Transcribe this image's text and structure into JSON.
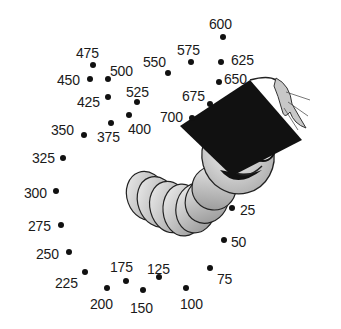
{
  "worksheet": {
    "title": "",
    "picture": "graduate-worm-with-glasses-and-mortarboard",
    "colors": {
      "ink": "#111111",
      "worm_light": "#e8e8e8",
      "worm_dark": "#9a9a9a",
      "cap": "#111111",
      "tassel": "#c8c8c8"
    },
    "dots": [
      {
        "label": "25",
        "x": 232,
        "y": 208,
        "lx": 240,
        "ly": 203
      },
      {
        "label": "50",
        "x": 224,
        "y": 240,
        "lx": 231,
        "ly": 235
      },
      {
        "label": "75",
        "x": 210,
        "y": 268,
        "lx": 217,
        "ly": 272
      },
      {
        "label": "100",
        "x": 186,
        "y": 288,
        "lx": 180,
        "ly": 297
      },
      {
        "label": "125",
        "x": 159,
        "y": 277,
        "lx": 147,
        "ly": 262
      },
      {
        "label": "150",
        "x": 143,
        "y": 290,
        "lx": 130,
        "ly": 301
      },
      {
        "label": "175",
        "x": 126,
        "y": 281,
        "lx": 110,
        "ly": 260
      },
      {
        "label": "200",
        "x": 107,
        "y": 288,
        "lx": 90,
        "ly": 297
      },
      {
        "label": "225",
        "x": 85,
        "y": 272,
        "lx": 55,
        "ly": 276
      },
      {
        "label": "250",
        "x": 69,
        "y": 252,
        "lx": 36,
        "ly": 247
      },
      {
        "label": "275",
        "x": 61,
        "y": 225,
        "lx": 28,
        "ly": 219
      },
      {
        "label": "300",
        "x": 56,
        "y": 191,
        "lx": 24,
        "ly": 186
      },
      {
        "label": "325",
        "x": 63,
        "y": 158,
        "lx": 32,
        "ly": 151
      },
      {
        "label": "350",
        "x": 84,
        "y": 135,
        "lx": 51,
        "ly": 123
      },
      {
        "label": "375",
        "x": 111,
        "y": 123,
        "lx": 97,
        "ly": 130
      },
      {
        "label": "400",
        "x": 129,
        "y": 115,
        "lx": 128,
        "ly": 122
      },
      {
        "label": "425",
        "x": 108,
        "y": 97,
        "lx": 77,
        "ly": 95
      },
      {
        "label": "450",
        "x": 90,
        "y": 79,
        "lx": 57,
        "ly": 73
      },
      {
        "label": "475",
        "x": 93,
        "y": 65,
        "lx": 76,
        "ly": 46
      },
      {
        "label": "500",
        "x": 108,
        "y": 79,
        "lx": 110,
        "ly": 64
      },
      {
        "label": "525",
        "x": 137,
        "y": 102,
        "lx": 126,
        "ly": 85
      },
      {
        "label": "550",
        "x": 168,
        "y": 73,
        "lx": 143,
        "ly": 55
      },
      {
        "label": "575",
        "x": 191,
        "y": 62,
        "lx": 177,
        "ly": 43
      },
      {
        "label": "600",
        "x": 223,
        "y": 37,
        "lx": 209,
        "ly": 17
      },
      {
        "label": "625",
        "x": 221,
        "y": 62,
        "lx": 231,
        "ly": 53
      },
      {
        "label": "650",
        "x": 219,
        "y": 82,
        "lx": 224,
        "ly": 72
      },
      {
        "label": "675",
        "x": 210,
        "y": 104,
        "lx": 182,
        "ly": 89
      },
      {
        "label": "700",
        "x": 192,
        "y": 118,
        "lx": 160,
        "ly": 110
      }
    ]
  }
}
